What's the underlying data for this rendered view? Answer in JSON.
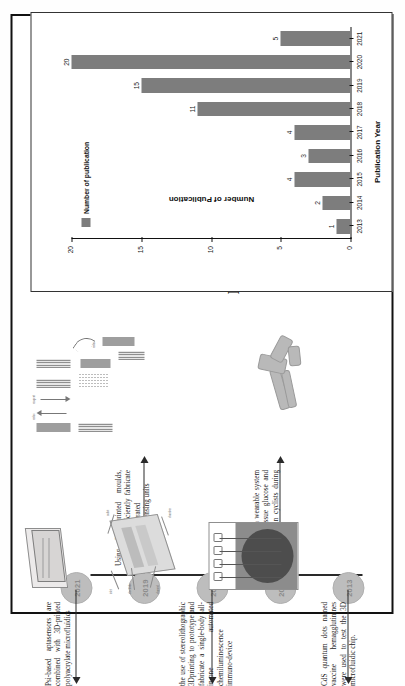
{
  "figure": {
    "panel_a_letter": "A",
    "panel_b_letter": "B"
  },
  "timeline": {
    "nodes": [
      {
        "year": "2013"
      },
      {
        "year": "2015"
      },
      {
        "year": "2017"
      },
      {
        "year": "2019"
      },
      {
        "year": "2021"
      }
    ],
    "captions": [
      {
        "year": "2013",
        "text": "CdS quantum dots named vaccine hemagglutinines were used to test the 3D microfluidic chip."
      },
      {
        "year": "2015",
        "text": "Its abilitiesas a wearable system for tracking tissue glucose and lactate levels in cyclists during exercise"
      },
      {
        "year": "2017",
        "text": "the use of stereolithographic 3Dprinting to prototype and fabricate a single-body all-in-one automated chemiluminescence immuno-device"
      },
      {
        "year": "2019",
        "text": "Using 3D printed moulds, quickly and efficiently fabricate microvalve-integrated multiplexed biosensing units"
      },
      {
        "year": "2021",
        "text": "Psi-based aptasensors are combined with 3D-printed polyacrylate microfluidics"
      }
    ],
    "thumb_labels": {
      "device_inlet": "inlet",
      "device_outlet": "outlet",
      "device_electrode": "electrode",
      "device_channel": "channel",
      "device_chamber": "chamber",
      "strip_up": "redox",
      "strip_dn": "reagent"
    }
  },
  "chart_data": {
    "type": "bar",
    "title": "",
    "xlabel": "Publication Year",
    "ylabel": "Number of Publication",
    "legend": [
      "Number of publication"
    ],
    "legend_position": "top-left",
    "grid": false,
    "categories": [
      "2013",
      "2014",
      "2015",
      "2016",
      "2017",
      "2018",
      "2019",
      "2020",
      "2021"
    ],
    "values": [
      1,
      2,
      4,
      3,
      4,
      11,
      15,
      20,
      5
    ],
    "ylim": [
      0,
      20
    ],
    "yticks": [
      0,
      5,
      10,
      15,
      20
    ],
    "bar_color": "#7d7d7d"
  }
}
